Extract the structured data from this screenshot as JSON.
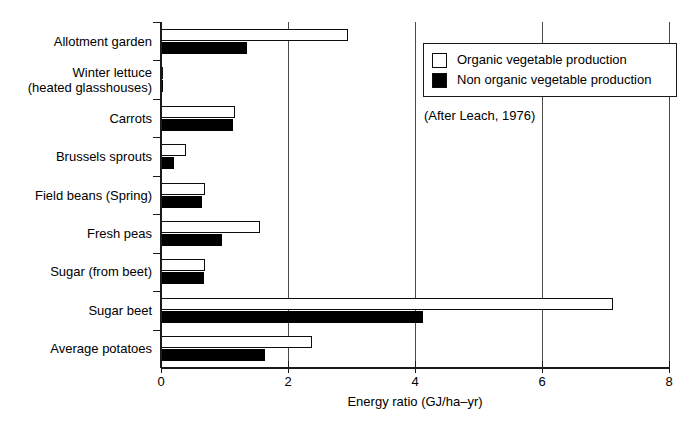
{
  "chart_data": {
    "type": "bar",
    "orientation": "horizontal",
    "title": "",
    "xlabel": "Energy ratio (GJ/ha–yr)",
    "ylabel": "",
    "xlim": [
      0,
      8
    ],
    "xticks": [
      0,
      2,
      4,
      6,
      8
    ],
    "xtick_labels": [
      "0",
      "2",
      "4",
      "6",
      "8"
    ],
    "grid": "vertical",
    "categories": [
      "Allotment garden",
      "Winter lettuce (heated glasshouses)",
      "Carrots",
      "Brussels sprouts",
      "Field beans (Spring)",
      "Fresh peas",
      "Sugar (from beet)",
      "Sugar beet",
      "Average potatoes"
    ],
    "category_labels": [
      [
        "Allotment garden"
      ],
      [
        "Winter lettuce",
        "(heated glasshouses)"
      ],
      [
        "Carrots"
      ],
      [
        "Brussels sprouts"
      ],
      [
        "Field beans (Spring)"
      ],
      [
        "Fresh peas"
      ],
      [
        "Sugar (from beet)"
      ],
      [
        "Sugar beet"
      ],
      [
        "Average potatoes"
      ]
    ],
    "series": [
      {
        "name": "Organic vegetable production",
        "style": "hollow",
        "color": "#ffffff",
        "edge_color": "#0d0d0d",
        "values": [
          2.94,
          0.02,
          1.17,
          0.39,
          0.69,
          1.56,
          0.69,
          7.12,
          2.38
        ]
      },
      {
        "name": "Non organic vegetable production",
        "style": "filled",
        "color": "#000000",
        "edge_color": "#000000",
        "values": [
          1.35,
          0.02,
          1.13,
          0.2,
          0.64,
          0.96,
          0.68,
          4.13,
          1.64
        ]
      }
    ],
    "legend": {
      "position": "top-right",
      "entries": [
        {
          "label": "Organic vegetable production",
          "style": "hollow"
        },
        {
          "label": "Non organic vegetable production",
          "style": "filled"
        }
      ]
    },
    "annotations": [
      {
        "text": "(After Leach, 1976)",
        "position": "below-legend"
      }
    ]
  }
}
